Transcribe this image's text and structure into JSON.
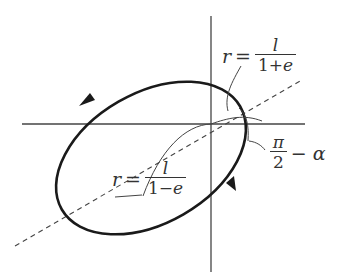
{
  "figure": {
    "type": "orbit-ellipse-diagram",
    "labels": {
      "top_eq": {
        "var": "r",
        "op": "=",
        "num": "l",
        "den_a": "1+",
        "den_b": "e"
      },
      "bottom_eq": {
        "var": "r",
        "op": "=",
        "num": "l",
        "den_a": "1−",
        "den_b": "e"
      },
      "angle": {
        "num": "π",
        "den": "2",
        "rest": "− α"
      }
    },
    "colors": {
      "line": "#222222",
      "thin": "#444444",
      "text": "#333333"
    }
  }
}
